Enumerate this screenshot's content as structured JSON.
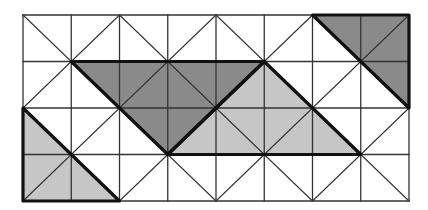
{
  "diagram": {
    "type": "triangular-grid-tiling",
    "grid": {
      "cols": 8,
      "rows": 4,
      "origin_px": [
        23,
        15
      ],
      "cell_w_px": 48.25,
      "cell_h_px": 46.5,
      "line_color": "#333333",
      "diagonal_pattern": "X-centered-at-odd-odd-vertices"
    },
    "colors": {
      "dark": "#8a8a8a",
      "light": "#c6c6c6",
      "outline": "#111111",
      "background": "#ffffff"
    },
    "shapes": [
      {
        "name": "dark-triangle-top-right",
        "fill": "dark",
        "points": [
          [
            6,
            0
          ],
          [
            8,
            0
          ],
          [
            8,
            2
          ]
        ]
      },
      {
        "name": "dark-triangle-center",
        "fill": "dark",
        "points": [
          [
            1,
            1
          ],
          [
            5,
            1
          ],
          [
            3,
            3
          ]
        ]
      },
      {
        "name": "light-triangle-center",
        "fill": "light",
        "points": [
          [
            5,
            1
          ],
          [
            3,
            3
          ],
          [
            7,
            3
          ]
        ]
      },
      {
        "name": "light-triangle-bottom-left",
        "fill": "light",
        "points": [
          [
            0,
            2
          ],
          [
            0,
            4
          ],
          [
            2,
            4
          ]
        ]
      }
    ]
  }
}
